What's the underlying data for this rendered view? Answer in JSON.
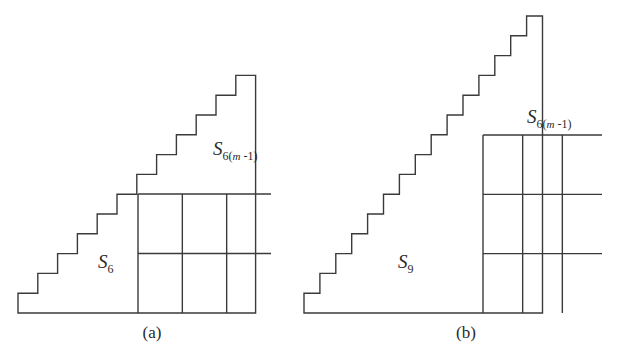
{
  "figure": {
    "background_color": "#ffffff",
    "line_color": "#3a3a3a",
    "text_color": "#2a2a2a"
  },
  "panels": [
    {
      "id": "a",
      "caption": "(a)",
      "caption_x": 152,
      "caption_y": 338,
      "lower_label": {
        "base": "S",
        "sub": "6",
        "x": 98,
        "y": 268
      },
      "upper_label": {
        "base": "S",
        "sub_prefix": "6(",
        "sub_var": "m",
        "sub_suffix": " -1)",
        "x": 213,
        "y": 155
      },
      "geometry": {
        "origin_x": 18,
        "baseline_y": 313,
        "step_w": 19.8,
        "step_h": 19.8,
        "lower_steps": 6,
        "upper_steps": 6,
        "grid_cols": 3,
        "grid_rows": 2,
        "grid_left": 138,
        "grid_right": 271,
        "grid_top": 194,
        "grid_bottom": 313
      }
    },
    {
      "id": "b",
      "caption": "(b)",
      "caption_x": 466,
      "caption_y": 338,
      "lower_label": {
        "base": "S",
        "sub": "9",
        "x": 398,
        "y": 268
      },
      "upper_label": {
        "base": "S",
        "sub_prefix": "6(",
        "sub_var": "m",
        "sub_suffix": " -1)",
        "x": 527,
        "y": 123
      },
      "geometry": {
        "origin_x": 304,
        "baseline_y": 313,
        "step_w": 15.9,
        "step_h": 19.8,
        "lower_steps": 9,
        "upper_steps": 6,
        "grid_cols": 3,
        "grid_rows": 3,
        "grid_left": 483,
        "grid_right": 602,
        "grid_top": 135,
        "grid_bottom": 313
      }
    }
  ],
  "chart_data": {
    "type": "diagram",
    "title": "",
    "panels": [
      {
        "label": "(a)",
        "total_steps": 12,
        "lower_region": {
          "name": "S_6",
          "steps": 6
        },
        "upper_region": {
          "name": "S_6(m-1)",
          "steps": 6
        },
        "grid": {
          "cols": 3,
          "rows": 2,
          "cells": 6
        }
      },
      {
        "label": "(b)",
        "total_steps": 15,
        "lower_region": {
          "name": "S_9",
          "steps": 9
        },
        "upper_region": {
          "name": "S_6(m-1)",
          "steps": 6
        },
        "grid": {
          "cols": 3,
          "rows": 3,
          "cells": 9
        }
      }
    ]
  }
}
